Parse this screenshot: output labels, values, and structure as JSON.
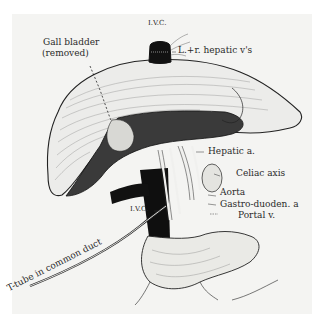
{
  "figure": {
    "background_color": "#f4f4f2",
    "ink_color": "#1e1e1e"
  },
  "labels": {
    "ivc_top": "I.V.C.",
    "gall_bladder_line1": "Gall bladder",
    "gall_bladder_line2": "(removed)",
    "hepatic_veins": "L.+r. hepatic v's",
    "hepatic_artery": "Hepatic a.",
    "celiac_axis": "Celiac axis",
    "ivc_lower": "I.V.C.",
    "aorta": "Aorta",
    "gastroduodenal": "Gastro-duoden. a",
    "portal_vein": "Portal v.",
    "t_tube": "T-tube in common duct"
  }
}
